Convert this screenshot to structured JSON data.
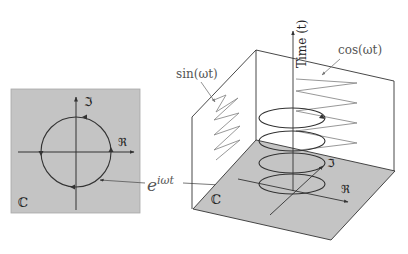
{
  "left_panel": {
    "plane_label": "ℂ",
    "imag_label": "ℑ",
    "real_label": "ℜ"
  },
  "center_label": {
    "base": "e",
    "exponent": "iωt"
  },
  "box3d": {
    "time_axis_label": "Time (t)",
    "sin_label": "sin(ωt)",
    "cos_label": "cos(ωt)",
    "plane_label": "ℂ",
    "imag_label": "ℑ",
    "real_label": "ℜ"
  },
  "colors": {
    "plane_fill": "#c4c4c4",
    "line": "#333333",
    "wave": "#8c8c8c",
    "label": "#666666"
  }
}
